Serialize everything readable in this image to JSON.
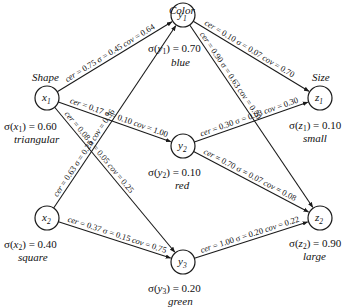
{
  "groups": [
    {
      "id": "shape",
      "title": "Shape"
    },
    {
      "id": "color",
      "title": "Color"
    },
    {
      "id": "size",
      "title": "Size"
    }
  ],
  "nodes": [
    {
      "id": "x1",
      "var": "x",
      "sub": "1",
      "sigma": "σ(x1) = 0.60",
      "sigma_value": "0.60",
      "category": "triangular"
    },
    {
      "id": "x2",
      "var": "x",
      "sub": "2",
      "sigma": "σ(x2) = 0.40",
      "sigma_value": "0.40",
      "category": "square"
    },
    {
      "id": "y1",
      "var": "y",
      "sub": "1",
      "sigma": "σ(y1) = 0.70",
      "sigma_value": "0.70",
      "category": "blue"
    },
    {
      "id": "y2",
      "var": "y",
      "sub": "2",
      "sigma": "σ(y2) = 0.10",
      "sigma_value": "0.10",
      "category": "red"
    },
    {
      "id": "y3",
      "var": "y",
      "sub": "3",
      "sigma": "σ(y3) = 0.20",
      "sigma_value": "0.20",
      "category": "green"
    },
    {
      "id": "z1",
      "var": "z",
      "sub": "1",
      "sigma": "σ(z1) = 0.10",
      "sigma_value": "0.10",
      "category": "small"
    },
    {
      "id": "z2",
      "var": "z",
      "sub": "2",
      "sigma": "σ(z2) = 0.90",
      "sigma_value": "0.90",
      "category": "large"
    }
  ],
  "edges": [
    {
      "from": "x1",
      "to": "y1",
      "cer": "0.75",
      "sigma": "0.45",
      "cov": "0.64"
    },
    {
      "from": "x1",
      "to": "y2",
      "cer": "0.17",
      "sigma": "0.10",
      "cov": "1.00"
    },
    {
      "from": "x1",
      "to": "y3",
      "cer": "0.08",
      "sigma": "0.05",
      "cov": "0.25"
    },
    {
      "from": "x2",
      "to": "y1",
      "cer": "0.63",
      "sigma": "0.25",
      "cov": "0.36"
    },
    {
      "from": "x2",
      "to": "y3",
      "cer": "0.37",
      "sigma": "0.15",
      "cov": "0.75"
    },
    {
      "from": "y1",
      "to": "z1",
      "cer": "0.10",
      "sigma": "0.07",
      "cov": "0.70"
    },
    {
      "from": "y1",
      "to": "z2",
      "cer": "0.90",
      "sigma": "0.63",
      "cov": "0.70"
    },
    {
      "from": "y2",
      "to": "z1",
      "cer": "0.30",
      "sigma": "0.03",
      "cov": "0.30"
    },
    {
      "from": "y2",
      "to": "z2",
      "cer": "0.70",
      "sigma": "0.07",
      "cov": "0.08"
    },
    {
      "from": "y3",
      "to": "z2",
      "cer": "1.00",
      "sigma": "0.20",
      "cov": "0.22"
    }
  ],
  "text": {
    "cer_prefix": "cer = ",
    "sigma_prefix": "σ = ",
    "cov_prefix": "cov = "
  }
}
